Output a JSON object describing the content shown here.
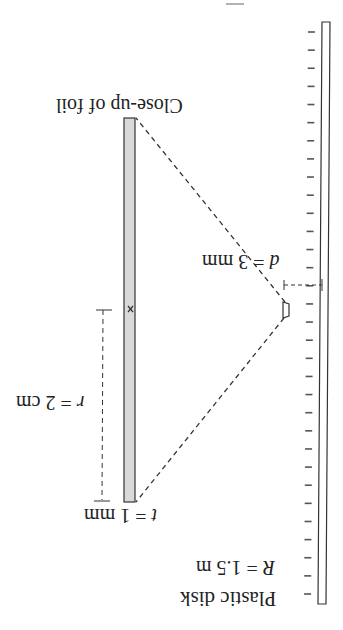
{
  "figure": {
    "orientation": "rotated 180 degrees",
    "page_number_fragment": "—",
    "labels": {
      "close_up": "Close-up of foil",
      "d_var": "d",
      "d_value": " = 3 mm",
      "r_var": "r",
      "r_value": " = 2 cm",
      "t_var": "t",
      "t_value": " = 1 mm",
      "disk_name": "Plastic disk",
      "R_var": "R",
      "R_value": " = 1.5 m"
    },
    "components": {
      "plastic_disk": {
        "radius": "1.5 m",
        "tick_count": 32
      },
      "foil": {
        "thickness": "1 mm",
        "radius": "2 cm",
        "distance_from_disk_edge": "3 mm"
      }
    },
    "colors": {
      "line": "#333333",
      "foil_fill": "#d9d9d9",
      "background": "#ffffff"
    }
  }
}
